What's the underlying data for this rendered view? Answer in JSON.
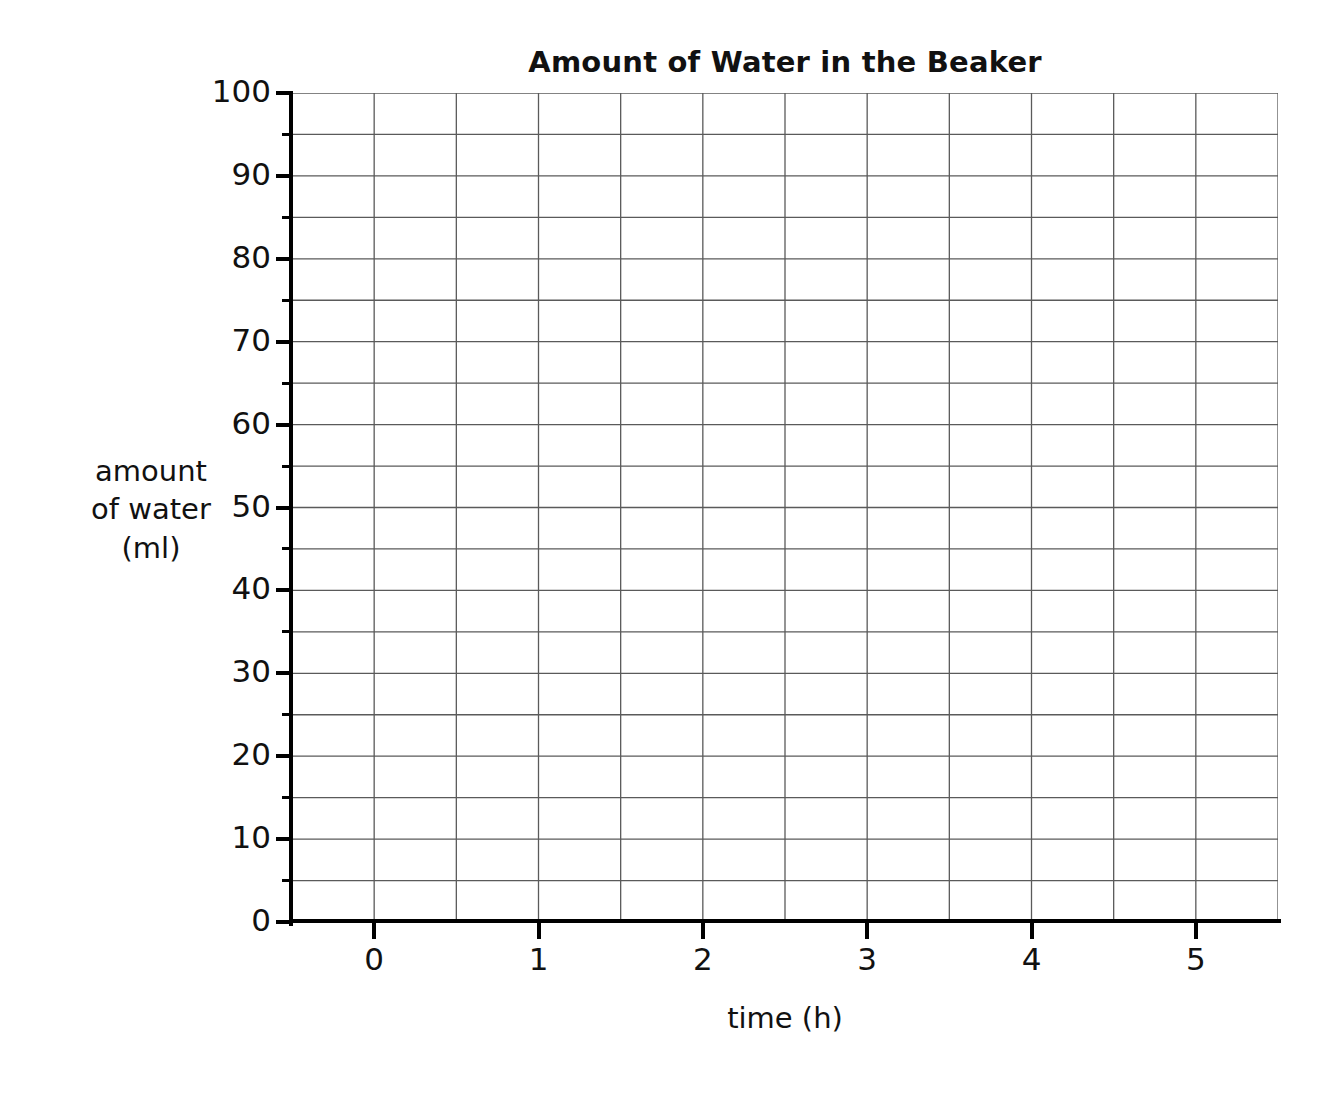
{
  "chart_data": {
    "type": "line",
    "title": "Amount of Water in the Beaker",
    "xlabel": "time (h)",
    "ylabel_lines": [
      "amount",
      "of water",
      "(ml)"
    ],
    "ylabel": "amount of water (ml)",
    "xlim": [
      -0.5,
      5.5
    ],
    "ylim": [
      0,
      100
    ],
    "x_ticks": [
      0,
      1,
      2,
      3,
      4,
      5
    ],
    "x_tick_labels": [
      "0",
      "1",
      "2",
      "3",
      "4",
      "5"
    ],
    "x_minor_step": 0.5,
    "y_ticks": [
      0,
      10,
      20,
      30,
      40,
      50,
      60,
      70,
      80,
      90,
      100
    ],
    "y_tick_labels": [
      "0",
      "10",
      "20",
      "30",
      "40",
      "50",
      "60",
      "70",
      "80",
      "90",
      "100"
    ],
    "y_minor_step": 5,
    "grid": true,
    "grid_color": "#5a5a5a",
    "axis_color": "#000000",
    "background": "#ffffff",
    "legend": null,
    "series": [],
    "values": [],
    "note": "Empty grid template - no data plotted"
  },
  "chart": {
    "title": "Amount of Water in the Beaker",
    "x_axis_title": "time (h)",
    "y_axis_title_line1": "amount",
    "y_axis_title_line2": "of water",
    "y_axis_title_line3": "(ml)"
  }
}
